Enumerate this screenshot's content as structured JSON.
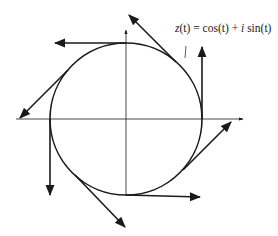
{
  "diagram": {
    "label": "z(t) = cos(t) + i sin(t)",
    "label_parts": {
      "lhs_fn": "z",
      "lhs_arg": "(t)",
      "eq": " = ",
      "cos": "cos",
      "cos_arg": "(t)",
      "plus": " + ",
      "i": "i",
      "sin": " sin",
      "sin_arg": "(t)"
    },
    "colors": {
      "stroke": "#1a1a1a",
      "background": "#ffffff"
    },
    "circle": {
      "cx": 126,
      "cy": 119,
      "r": 76
    },
    "vectors": [
      {
        "name": "top",
        "from": [
          126,
          43
        ],
        "to": [
          55,
          43
        ]
      },
      {
        "name": "upper-right",
        "from": [
          176,
          62
        ],
        "to": [
          129,
          15
        ]
      },
      {
        "name": "right",
        "from": [
          202,
          119
        ],
        "to": [
          202,
          47
        ]
      },
      {
        "name": "lower-right",
        "from": [
          183,
          170
        ],
        "to": [
          231,
          122
        ]
      },
      {
        "name": "bottom",
        "from": [
          126,
          195
        ],
        "to": [
          200,
          197
        ]
      },
      {
        "name": "lower-left",
        "from": [
          75,
          175
        ],
        "to": [
          125,
          227
        ]
      },
      {
        "name": "left",
        "from": [
          50,
          119
        ],
        "to": [
          50,
          195
        ]
      },
      {
        "name": "upper-left",
        "from": [
          68,
          70
        ],
        "to": [
          20,
          118
        ]
      }
    ]
  }
}
